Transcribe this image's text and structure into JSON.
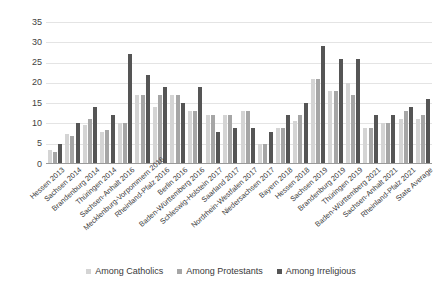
{
  "chart_data": {
    "type": "bar",
    "title": "",
    "subtitle": "",
    "xlabel": "",
    "ylabel": "",
    "ylim": [
      0,
      35
    ],
    "yticks": [
      0,
      5,
      10,
      15,
      20,
      25,
      30,
      35
    ],
    "grid": true,
    "legend_position": "bottom",
    "categories": [
      "Hessen 2013",
      "Sachsen 2014",
      "Brandenburg 2014",
      "Thüringen 2014",
      "Sachsen-Anhalt 2016",
      "Mecklenburg-Vorpommern 2016",
      "Rheinland-Pfalz 2016",
      "Berlin 2016",
      "Baden-Württemberg 2016",
      "Schleswig-Holstein 2017",
      "Saarland 2017",
      "Nordrhein-Westfalen 2017",
      "Niedersachsen 2017",
      "Bayern 2018",
      "Hessen 2018",
      "Sachsen 2019",
      "Brandenburg 2019",
      "Thüringen 2019",
      "Baden-Württemberg 2021",
      "Sachsen-Anhalt 2021",
      "Rheinland-Pfalz 2021",
      "State Average"
    ],
    "series": [
      {
        "name": "Among Catholics",
        "color": "#d4d4d4",
        "values": [
          3.5,
          7.5,
          9.5,
          8,
          10,
          17,
          14,
          17,
          13,
          12,
          12,
          13,
          5,
          9,
          10.5,
          21,
          18,
          20,
          9,
          10,
          11,
          11
        ]
      },
      {
        "name": "Among Protestants",
        "color": "#a6a6a6",
        "values": [
          3,
          7,
          11,
          8.5,
          10,
          17,
          17,
          17,
          13,
          12,
          12,
          13,
          5,
          9,
          12,
          21,
          18,
          17,
          9,
          10,
          13,
          12
        ]
      },
      {
        "name": "Among Irreligious",
        "color": "#555555",
        "values": [
          5,
          10,
          14,
          12,
          27,
          22,
          19,
          15,
          19,
          8,
          9,
          9,
          8,
          12,
          15,
          29,
          26,
          26,
          12,
          12,
          14,
          16
        ]
      }
    ]
  },
  "legend": {
    "items": [
      {
        "label": "Among Catholics"
      },
      {
        "label": "Among Protestants"
      },
      {
        "label": "Among Irreligious"
      }
    ]
  }
}
